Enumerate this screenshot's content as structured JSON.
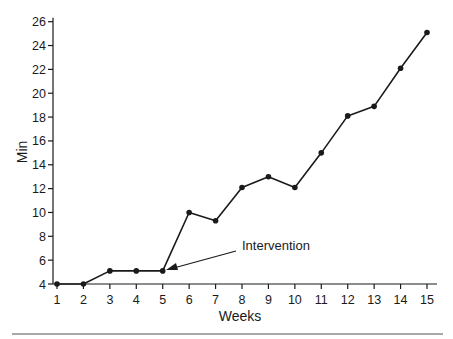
{
  "chart_data": {
    "type": "line",
    "title": "",
    "xlabel": "Weeks",
    "ylabel": "Min",
    "x": [
      1,
      2,
      3,
      4,
      5,
      6,
      7,
      8,
      9,
      10,
      11,
      12,
      13,
      14,
      15
    ],
    "series": [
      {
        "name": "Min",
        "values": [
          4,
          4,
          5.1,
          5.1,
          5.1,
          10,
          9.3,
          12.1,
          13,
          12.1,
          15,
          18.1,
          18.9,
          22.1,
          25.1
        ]
      }
    ],
    "xticks": [
      "1",
      "2",
      "3",
      "4",
      "5",
      "6",
      "7",
      "8",
      "9",
      "10",
      "11",
      "12",
      "13",
      "14",
      "15"
    ],
    "yticks": [
      "4",
      "6",
      "8",
      "10",
      "12",
      "14",
      "16",
      "18",
      "20",
      "22",
      "24",
      "26"
    ],
    "xlim": [
      1,
      15
    ],
    "ylim": [
      4,
      26
    ],
    "grid": false,
    "legend": null,
    "annotations": [
      {
        "text": "Intervention",
        "points_to": {
          "x": 5,
          "y": 5.1
        }
      }
    ],
    "colors": {
      "line": "#1a1a1a",
      "marker": "#1a1a1a",
      "axis": "#1a1a1a",
      "divider": "#555555"
    }
  }
}
